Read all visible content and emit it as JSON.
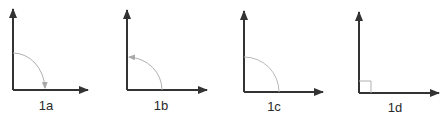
{
  "figure": {
    "panels": [
      {
        "id": "1a",
        "label": "1a",
        "arc": "quarter-circle",
        "arrow_direction": "clockwise",
        "arrow_end": "horizontal-axis"
      },
      {
        "id": "1b",
        "label": "1b",
        "arc": "quarter-circle",
        "arrow_direction": "counterclockwise",
        "arrow_end": "vertical-axis"
      },
      {
        "id": "1c",
        "label": "1c",
        "arc": "quarter-circle",
        "arrow_direction": "none",
        "arrow_end": "none"
      },
      {
        "id": "1d",
        "label": "1d",
        "arc": "right-angle-square",
        "arrow_direction": "none",
        "arrow_end": "none"
      }
    ],
    "colors": {
      "axis": "#333333",
      "arc": "#b0b0b0",
      "label": "#2a2a2a",
      "background": "#ffffff"
    }
  }
}
